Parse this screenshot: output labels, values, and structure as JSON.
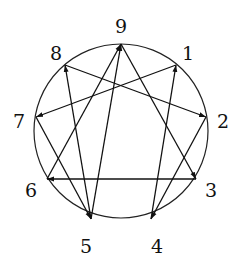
{
  "diagram": {
    "title": "",
    "circle": {
      "cx": 121,
      "cy": 131,
      "r": 87,
      "stroke": "#222222"
    },
    "points": [
      {
        "id": "9",
        "x": 121,
        "y": 44,
        "label": "9",
        "lx": 121,
        "ly": 28
      },
      {
        "id": "1",
        "x": 176,
        "y": 65,
        "label": "1",
        "lx": 188,
        "ly": 55
      },
      {
        "id": "2",
        "x": 206,
        "y": 117,
        "label": "2",
        "lx": 223,
        "ly": 123
      },
      {
        "id": "3",
        "x": 196,
        "y": 179,
        "label": "3",
        "lx": 211,
        "ly": 192
      },
      {
        "id": "4",
        "x": 151,
        "y": 219,
        "label": "4",
        "lx": 157,
        "ly": 248
      },
      {
        "id": "5",
        "x": 91,
        "y": 219,
        "label": "5",
        "lx": 86,
        "ly": 248
      },
      {
        "id": "6",
        "x": 47,
        "y": 179,
        "label": "6",
        "lx": 31,
        "ly": 192
      },
      {
        "id": "7",
        "x": 36,
        "y": 117,
        "label": "7",
        "lx": 19,
        "ly": 123
      },
      {
        "id": "8",
        "x": 65,
        "y": 65,
        "label": "8",
        "lx": 56,
        "ly": 55
      }
    ],
    "arrows": [
      {
        "from": "5",
        "to": "9"
      },
      {
        "from": "9",
        "to": "3"
      },
      {
        "from": "3",
        "to": "6"
      },
      {
        "from": "6",
        "to": "9"
      },
      {
        "from": "8",
        "to": "2"
      },
      {
        "from": "2",
        "to": "4"
      },
      {
        "from": "4",
        "to": "1"
      },
      {
        "from": "1",
        "to": "7"
      },
      {
        "from": "7",
        "to": "5"
      },
      {
        "from": "5",
        "to": "8"
      }
    ]
  }
}
